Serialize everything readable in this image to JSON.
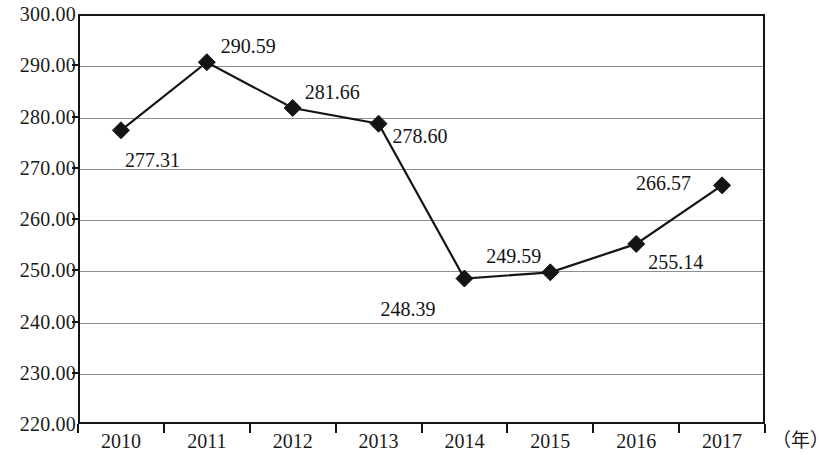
{
  "chart_data": {
    "type": "line",
    "title": "",
    "xlabel": "（年）",
    "ylabel": "",
    "categories": [
      "2010",
      "2011",
      "2012",
      "2013",
      "2014",
      "2015",
      "2016",
      "2017"
    ],
    "values": [
      277.31,
      290.59,
      281.66,
      278.6,
      248.39,
      249.59,
      255.14,
      266.57
    ],
    "point_labels": [
      "277.31",
      "290.59",
      "281.66",
      "278.60",
      "248.39",
      "249.59",
      "255.14",
      "266.57"
    ],
    "ylim": [
      220.0,
      300.0
    ],
    "y_ticks": [
      300.0,
      290.0,
      280.0,
      270.0,
      260.0,
      250.0,
      240.0,
      230.0,
      220.0
    ],
    "y_tick_labels": [
      "300.00",
      "290.00",
      "280.00",
      "270.00",
      "260.00",
      "250.00",
      "240.00",
      "230.00",
      "220.00"
    ],
    "grid": true,
    "legend": "none",
    "marker": "diamond",
    "series": [
      {
        "name": "",
        "values": [
          277.31,
          290.59,
          281.66,
          278.6,
          248.39,
          249.59,
          255.14,
          266.57
        ]
      }
    ],
    "colors": {
      "line": "#141414",
      "marker": "#141414",
      "grid": "#8d8d8d",
      "frame": "#141414",
      "background": "#ffffff",
      "text": "#141414"
    },
    "label_offsets": [
      {
        "dx": 4,
        "dy": 20
      },
      {
        "dx": 14,
        "dy": -26
      },
      {
        "dx": 12,
        "dy": -26
      },
      {
        "dx": 14,
        "dy": 2
      },
      {
        "dx": -84,
        "dy": 20
      },
      {
        "dx": -64,
        "dy": -26
      },
      {
        "dx": 12,
        "dy": 8
      },
      {
        "dx": -86,
        "dy": -12
      }
    ]
  }
}
